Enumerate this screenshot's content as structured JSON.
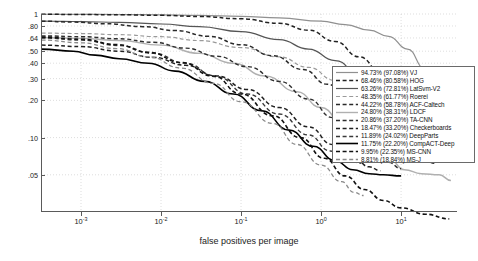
{
  "chart_data": {
    "type": "line",
    "title": "",
    "xlabel": "false positives per image",
    "ylabel": "miss rate",
    "xscale": "log",
    "yscale": "log",
    "xlim": [
      0.00031623,
      50
    ],
    "ylim": [
      0.025,
      1.0
    ],
    "grid": true,
    "legend_position": "right-outside",
    "xticks": [
      {
        "value": 0.001,
        "label": "10",
        "exp": "-3"
      },
      {
        "value": 0.01,
        "label": "10",
        "exp": "-2"
      },
      {
        "value": 0.1,
        "label": "10",
        "exp": "-1"
      },
      {
        "value": 1,
        "label": "10",
        "exp": "0"
      },
      {
        "value": 10,
        "label": "10",
        "exp": "1"
      }
    ],
    "yticks": [
      {
        "value": 1.0,
        "label": "1"
      },
      {
        "value": 0.8,
        "label": ".80"
      },
      {
        "value": 0.64,
        "label": ".64"
      },
      {
        "value": 0.5,
        "label": ".50"
      },
      {
        "value": 0.4,
        "label": ".40"
      },
      {
        "value": 0.3,
        "label": ".30"
      },
      {
        "value": 0.2,
        "label": ".20"
      },
      {
        "value": 0.1,
        "label": ".10"
      },
      {
        "value": 0.05,
        "label": ".05"
      }
    ],
    "series": [
      {
        "name": "VJ",
        "legend_label": "94.73% (97.08%) VJ",
        "miss_rate": "94.73%",
        "miss_rate_secondary": "97.08%",
        "color": "#909090",
        "style": "solid",
        "width": 1.2,
        "points": [
          [
            0.00032,
            0.995
          ],
          [
            0.001,
            0.993
          ],
          [
            0.0032,
            0.99
          ],
          [
            0.01,
            0.985
          ],
          [
            0.03,
            0.975
          ],
          [
            0.1,
            0.958
          ],
          [
            0.3,
            0.93
          ],
          [
            1.0,
            0.875
          ],
          [
            2.0,
            0.82
          ],
          [
            4.0,
            0.74
          ],
          [
            7.0,
            0.66
          ],
          [
            12.0,
            0.52
          ],
          [
            20.0,
            0.36
          ],
          [
            30.0,
            0.28
          ],
          [
            42.0,
            0.245
          ]
        ]
      },
      {
        "name": "HOG",
        "legend_label": "68.46% (80.58%) HOG",
        "miss_rate": "68.46%",
        "miss_rate_secondary": "80.58%",
        "color": "#222222",
        "style": "dashed",
        "width": 1.5,
        "points": [
          [
            0.00032,
            0.995
          ],
          [
            0.001,
            0.99
          ],
          [
            0.0032,
            0.985
          ],
          [
            0.01,
            0.975
          ],
          [
            0.03,
            0.955
          ],
          [
            0.1,
            0.915
          ],
          [
            0.3,
            0.84
          ],
          [
            0.7,
            0.74
          ],
          [
            1.5,
            0.6
          ],
          [
            3.0,
            0.45
          ],
          [
            6.0,
            0.32
          ],
          [
            10.0,
            0.23
          ],
          [
            16.0,
            0.175
          ],
          [
            25.0,
            0.145
          ],
          [
            35.0,
            0.138
          ]
        ]
      },
      {
        "name": "LatSvm-V2",
        "legend_label": "63.26% (72.81%) LatSvm-V2",
        "miss_rate": "63.26%",
        "miss_rate_secondary": "72.81%",
        "color": "#555555",
        "style": "solid",
        "width": 1.2,
        "points": [
          [
            0.00032,
            0.875
          ],
          [
            0.0006,
            0.872
          ],
          [
            0.001,
            0.868
          ],
          [
            0.003,
            0.855
          ],
          [
            0.01,
            0.83
          ],
          [
            0.03,
            0.79
          ],
          [
            0.1,
            0.72
          ],
          [
            0.3,
            0.62
          ],
          [
            0.7,
            0.52
          ],
          [
            1.5,
            0.42
          ],
          [
            3.0,
            0.33
          ],
          [
            6.0,
            0.25
          ],
          [
            10.0,
            0.185
          ],
          [
            16.0,
            0.14
          ],
          [
            25.0,
            0.105
          ],
          [
            42.0,
            0.075
          ]
        ]
      },
      {
        "name": "Roerei",
        "legend_label": "48.35% (61.77%) Roerei",
        "miss_rate": "48.35%",
        "miss_rate_secondary": "61.77%",
        "color": "#9a9a9a",
        "style": "dashed",
        "width": 1.2,
        "points": [
          [
            0.00032,
            0.7
          ],
          [
            0.001,
            0.695
          ],
          [
            0.003,
            0.68
          ],
          [
            0.01,
            0.655
          ],
          [
            0.03,
            0.61
          ],
          [
            0.1,
            0.535
          ],
          [
            0.3,
            0.45
          ],
          [
            0.7,
            0.37
          ],
          [
            1.5,
            0.29
          ],
          [
            3.0,
            0.215
          ],
          [
            6.0,
            0.155
          ],
          [
            10.0,
            0.115
          ],
          [
            16.0,
            0.09
          ],
          [
            25.0,
            0.075
          ]
        ]
      },
      {
        "name": "ACF-Caltech",
        "legend_label": "44.22% (58.78%) ACF-Caltech",
        "miss_rate": "44.22%",
        "miss_rate_secondary": "58.78%",
        "color": "#2a2a2a",
        "style": "dashed",
        "width": 1.5,
        "points": [
          [
            0.00032,
            0.875
          ],
          [
            0.0008,
            0.86
          ],
          [
            0.002,
            0.835
          ],
          [
            0.006,
            0.79
          ],
          [
            0.015,
            0.735
          ],
          [
            0.04,
            0.66
          ],
          [
            0.1,
            0.565
          ],
          [
            0.25,
            0.46
          ],
          [
            0.6,
            0.355
          ],
          [
            1.2,
            0.27
          ],
          [
            2.5,
            0.2
          ],
          [
            5.0,
            0.145
          ],
          [
            9.0,
            0.105
          ],
          [
            16.0,
            0.078
          ],
          [
            26.0,
            0.062
          ]
        ]
      },
      {
        "name": "LDCF",
        "legend_label": "24.80% (38.31%) LDCF",
        "miss_rate": "24.80%",
        "miss_rate_secondary": "38.31%",
        "color": "#b0b0b0",
        "style": "solid",
        "width": 1.4,
        "points": [
          [
            0.00032,
            0.645
          ],
          [
            0.001,
            0.635
          ],
          [
            0.003,
            0.61
          ],
          [
            0.01,
            0.56
          ],
          [
            0.03,
            0.48
          ],
          [
            0.08,
            0.4
          ],
          [
            0.2,
            0.315
          ],
          [
            0.5,
            0.235
          ],
          [
            1.0,
            0.175
          ],
          [
            2.0,
            0.125
          ],
          [
            4.0,
            0.092
          ],
          [
            7.0,
            0.068
          ],
          [
            11.0,
            0.055
          ],
          [
            18.0,
            0.051
          ],
          [
            30.0,
            0.05
          ],
          [
            42.0,
            0.045
          ]
        ]
      },
      {
        "name": "TA-CNN",
        "legend_label": "20.86% (37.20%) TA-CNN",
        "miss_rate": "20.86%",
        "miss_rate_secondary": "37.20%",
        "color": "#2e2e2e",
        "style": "dashed",
        "width": 1.4,
        "points": [
          [
            0.00032,
            0.665
          ],
          [
            0.001,
            0.655
          ],
          [
            0.003,
            0.63
          ],
          [
            0.008,
            0.59
          ],
          [
            0.02,
            0.53
          ],
          [
            0.05,
            0.455
          ],
          [
            0.12,
            0.375
          ],
          [
            0.3,
            0.285
          ],
          [
            0.7,
            0.205
          ],
          [
            1.4,
            0.145
          ],
          [
            2.6,
            0.105
          ],
          [
            4.5,
            0.078
          ],
          [
            7.0,
            0.063
          ],
          [
            10.0,
            0.056
          ]
        ]
      },
      {
        "name": "Checkerboards",
        "legend_label": "18.47% (33.20%) Checkerboards",
        "miss_rate": "18.47%",
        "miss_rate_secondary": "33.20%",
        "color": "#202020",
        "style": "dashed",
        "width": 1.5,
        "points": [
          [
            0.00032,
            0.56
          ],
          [
            0.001,
            0.545
          ],
          [
            0.003,
            0.5
          ],
          [
            0.008,
            0.445
          ],
          [
            0.02,
            0.385
          ],
          [
            0.05,
            0.315
          ],
          [
            0.12,
            0.245
          ],
          [
            0.3,
            0.175
          ],
          [
            0.7,
            0.122
          ],
          [
            1.4,
            0.088
          ],
          [
            2.6,
            0.068
          ],
          [
            4.0,
            0.058
          ],
          [
            5.5,
            0.054
          ]
        ]
      },
      {
        "name": "DeepParts",
        "legend_label": "11.89% (24.02%) DeepParts",
        "miss_rate": "11.89%",
        "miss_rate_secondary": "24.02%",
        "color": "#3a3a3a",
        "style": "dashed",
        "width": 1.4,
        "points": [
          [
            0.00032,
            0.64
          ],
          [
            0.001,
            0.615
          ],
          [
            0.003,
            0.555
          ],
          [
            0.008,
            0.48
          ],
          [
            0.02,
            0.4
          ],
          [
            0.05,
            0.31
          ],
          [
            0.12,
            0.225
          ],
          [
            0.3,
            0.155
          ],
          [
            0.7,
            0.105
          ],
          [
            1.3,
            0.078
          ],
          [
            2.2,
            0.066
          ],
          [
            3.2,
            0.062
          ]
        ]
      },
      {
        "name": "CompACT-Deep",
        "legend_label": "11.75% (22.20%) CompACT-Deep",
        "miss_rate": "11.75%",
        "miss_rate_secondary": "22.20%",
        "color": "#000000",
        "style": "solid",
        "width": 1.6,
        "points": [
          [
            0.00032,
            0.52
          ],
          [
            0.0008,
            0.5
          ],
          [
            0.0015,
            0.465
          ],
          [
            0.003,
            0.435
          ],
          [
            0.007,
            0.4
          ],
          [
            0.015,
            0.345
          ],
          [
            0.035,
            0.285
          ],
          [
            0.08,
            0.225
          ],
          [
            0.18,
            0.165
          ],
          [
            0.4,
            0.115
          ],
          [
            0.8,
            0.085
          ],
          [
            1.5,
            0.065
          ],
          [
            2.5,
            0.055
          ],
          [
            4.0,
            0.051
          ],
          [
            6.0,
            0.05
          ],
          [
            10.0,
            0.049
          ]
        ]
      },
      {
        "name": "MS-CNN",
        "legend_label": "9.95% (22.35%) MS-CNN",
        "miss_rate": "9.95%",
        "miss_rate_secondary": "22.35%",
        "color": "#111111",
        "style": "dashed",
        "width": 1.6,
        "points": [
          [
            0.00032,
            0.65
          ],
          [
            0.001,
            0.625
          ],
          [
            0.0028,
            0.565
          ],
          [
            0.007,
            0.49
          ],
          [
            0.018,
            0.405
          ],
          [
            0.045,
            0.315
          ],
          [
            0.1,
            0.225
          ],
          [
            0.25,
            0.15
          ],
          [
            0.55,
            0.1
          ],
          [
            1.1,
            0.068
          ],
          [
            2.0,
            0.049
          ],
          [
            3.5,
            0.038
          ],
          [
            6.0,
            0.031
          ],
          [
            10.0,
            0.027
          ],
          [
            20.0,
            0.024
          ],
          [
            40.0,
            0.022
          ]
        ]
      },
      {
        "name": "MS-J",
        "legend_label": "8.81% (18.84%) MS-J",
        "miss_rate": "8.81%",
        "miss_rate_secondary": "18.84%",
        "color": "#8a8a8a",
        "style": "dashed",
        "width": 1.3,
        "points": [
          [
            0.00032,
            0.615
          ],
          [
            0.001,
            0.585
          ],
          [
            0.0028,
            0.525
          ],
          [
            0.007,
            0.45
          ],
          [
            0.018,
            0.365
          ],
          [
            0.045,
            0.275
          ],
          [
            0.1,
            0.195
          ],
          [
            0.25,
            0.13
          ],
          [
            0.5,
            0.088
          ],
          [
            1.0,
            0.06
          ],
          [
            1.8,
            0.044
          ],
          [
            2.6,
            0.036
          ],
          [
            3.4,
            0.034
          ]
        ]
      }
    ]
  }
}
